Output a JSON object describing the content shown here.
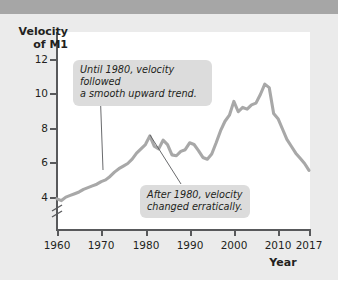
{
  "page": {
    "background_color": "#ebebeb",
    "topbar_color": "#a6a6a6"
  },
  "chart_data": {
    "type": "line",
    "title": "",
    "ylabel": "Velocity of M1",
    "ylabel_line1": "Velocity",
    "ylabel_line2": "of M1",
    "xlabel": "Year",
    "ylim": [
      3.2,
      12.8
    ],
    "xlim": [
      1960,
      2017
    ],
    "grid": false,
    "legend": "none",
    "y_axis_break": true,
    "line_color": "#a8a8a8",
    "axis_color": "#58595b",
    "yticks": [
      4,
      6,
      8,
      10,
      12
    ],
    "ytick_labels": [
      "4",
      "6",
      "8",
      "10",
      "12"
    ],
    "xticks": [
      1960,
      1970,
      1980,
      1990,
      2000,
      2010,
      2017
    ],
    "xtick_labels": [
      "1960",
      "1970",
      "1980",
      "1990",
      "2000",
      "2010",
      "2017"
    ],
    "series": [
      {
        "name": "Velocity of M1",
        "x": [
          1960,
          1961,
          1962,
          1963,
          1964,
          1965,
          1966,
          1967,
          1968,
          1969,
          1970,
          1971,
          1972,
          1973,
          1974,
          1975,
          1976,
          1977,
          1978,
          1979,
          1980,
          1981,
          1982,
          1983,
          1984,
          1985,
          1986,
          1987,
          1988,
          1989,
          1990,
          1991,
          1992,
          1993,
          1994,
          1995,
          1996,
          1997,
          1998,
          1999,
          2000,
          2001,
          2002,
          2003,
          2004,
          2005,
          2006,
          2007,
          2008,
          2009,
          2010,
          2011,
          2012,
          2013,
          2014,
          2015,
          2016,
          2017
        ],
        "values": [
          3.95,
          3.85,
          4.05,
          4.15,
          4.25,
          4.35,
          4.5,
          4.6,
          4.7,
          4.8,
          4.95,
          5.05,
          5.25,
          5.5,
          5.7,
          5.85,
          6.0,
          6.25,
          6.6,
          6.85,
          7.1,
          7.6,
          7.0,
          6.85,
          7.35,
          7.1,
          6.5,
          6.45,
          6.7,
          6.8,
          7.2,
          7.1,
          6.75,
          6.35,
          6.25,
          6.55,
          7.2,
          7.9,
          8.45,
          8.8,
          9.6,
          9.0,
          9.25,
          9.15,
          9.4,
          9.5,
          10.0,
          10.6,
          10.4,
          8.9,
          8.6,
          8.0,
          7.4,
          7.0,
          6.6,
          6.3,
          6.0,
          5.6
        ]
      }
    ],
    "annotations": [
      {
        "id": "callout-1",
        "text": "Until 1980, velocity followed a smooth upward trend.",
        "line1": "Until 1980, velocity followed",
        "line2": "a smooth upward trend.",
        "points_to_year": 1971,
        "points_to_value": 5.1
      },
      {
        "id": "callout-2",
        "text": "After 1980, velocity changed erratically.",
        "line1": "After 1980, velocity",
        "line2": "changed erratically.",
        "points_to_year": 1981,
        "points_to_value": 7.6
      }
    ]
  }
}
